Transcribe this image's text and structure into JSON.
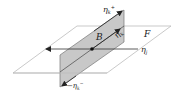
{
  "diagram": {
    "labels": {
      "plane_F": "F",
      "plane_B": "B",
      "eta_k_plus": "η",
      "eta_k_plus_sub": "k",
      "eta_k_plus_sup": "+",
      "eta_k": "η",
      "eta_k_sub": "k",
      "eta_j": "η",
      "eta_j_sub": "j",
      "neg_eta_k_minus_prefix": "−η",
      "neg_eta_k_minus_sub": "k",
      "neg_eta_k_minus_sup": "−"
    },
    "colors": {
      "plane_outline": "#bbbbbb",
      "shaded_plane": "#c8c8c8",
      "shaded_plane_edge": "#666666",
      "arrow": "#222222"
    }
  }
}
